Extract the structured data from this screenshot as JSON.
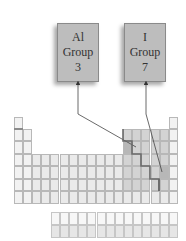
{
  "diagram": {
    "callouts": [
      {
        "id": "al",
        "symbol": "Al",
        "group_label": "Group",
        "group_number": "3"
      },
      {
        "id": "i",
        "symbol": "I",
        "group_label": "Group",
        "group_number": "7"
      }
    ],
    "periodic_table": {
      "columns": 18,
      "main_rows": 7,
      "f_block_rows": 2,
      "highlighted": [
        {
          "symbol": "Al",
          "group": 13,
          "period": 3
        },
        {
          "symbol": "I",
          "group": 17,
          "period": 5
        }
      ],
      "metal_nonmetal_boundary": "staircase"
    },
    "colors": {
      "callout_fill": "#bdbdbd",
      "cell_fill": "#eaeaea",
      "nonmetal_fill": "#d3d3d3",
      "highlight_fill": "#b7b7b7",
      "staircase_line": "#6a6a6a"
    }
  }
}
